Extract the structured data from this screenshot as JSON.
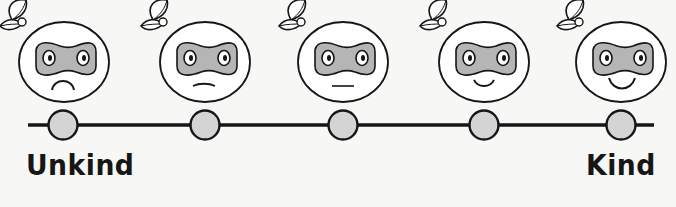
{
  "scale": {
    "left_label": "Unkind",
    "right_label": "Kind",
    "points": 5
  },
  "faces": [
    {
      "mood": "very-sad",
      "mouth": "frown-deep"
    },
    {
      "mood": "sad",
      "mouth": "frown-slight"
    },
    {
      "mood": "neutral",
      "mouth": "straight"
    },
    {
      "mood": "happy",
      "mouth": "smile-slight"
    },
    {
      "mood": "very-happy",
      "mouth": "smile-wide"
    }
  ],
  "colors": {
    "line": "#161616",
    "circle_fill": "#d4d4d4",
    "mask_fill": "#b5b5b5",
    "face_fill": "#ffffff",
    "background": "#f7f7f5"
  }
}
